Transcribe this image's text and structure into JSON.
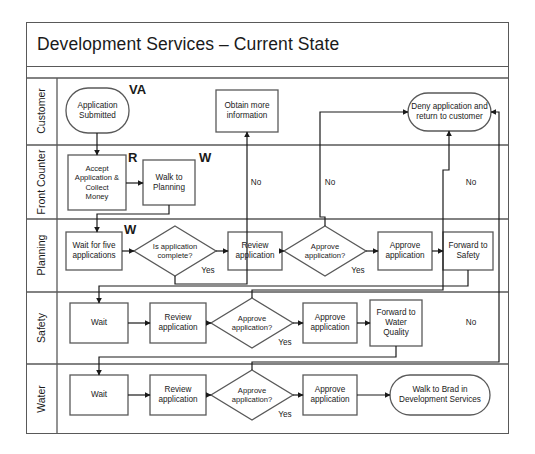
{
  "diagram": {
    "title": "Development Services – Current State",
    "type": "swimlane-flowchart",
    "stroke_color": "#595959",
    "frame_color": "#595959",
    "background": "#ffffff",
    "lanes": [
      {
        "id": "customer",
        "label": "Customer"
      },
      {
        "id": "front-counter",
        "label": "Front Counter"
      },
      {
        "id": "planning",
        "label": "Planning"
      },
      {
        "id": "safety",
        "label": "Safety"
      },
      {
        "id": "water",
        "label": "Water"
      }
    ],
    "nodes": [
      {
        "id": "application-submitted",
        "lane": "customer",
        "shape": "terminator",
        "text": "Application\nSubmitted"
      },
      {
        "id": "obtain-more-information",
        "lane": "customer",
        "shape": "process",
        "text": "Obtain more\ninformation"
      },
      {
        "id": "deny-application",
        "lane": "customer",
        "shape": "terminator",
        "text": "Deny application and\nreturn to customer"
      },
      {
        "id": "accept-application",
        "lane": "front-counter",
        "shape": "process",
        "text": "Accept\nApplication &\nCollect\nMoney"
      },
      {
        "id": "walk-to-planning",
        "lane": "front-counter",
        "shape": "process",
        "text": "Walk to\nPlanning"
      },
      {
        "id": "wait-for-five",
        "lane": "planning",
        "shape": "process",
        "text": "Wait for five\napplications"
      },
      {
        "id": "is-application-complete",
        "lane": "planning",
        "shape": "decision",
        "text": "Is application\ncomplete?"
      },
      {
        "id": "planning-review",
        "lane": "planning",
        "shape": "process",
        "text": "Review\napplication"
      },
      {
        "id": "planning-approve-q",
        "lane": "planning",
        "shape": "decision",
        "text": "Approve\napplication?"
      },
      {
        "id": "planning-approve",
        "lane": "planning",
        "shape": "process",
        "text": "Approve\napplication"
      },
      {
        "id": "forward-to-safety",
        "lane": "planning",
        "shape": "process",
        "text": "Forward to\nSafety"
      },
      {
        "id": "safety-wait",
        "lane": "safety",
        "shape": "process",
        "text": "Wait"
      },
      {
        "id": "safety-review",
        "lane": "safety",
        "shape": "process",
        "text": "Review\napplication"
      },
      {
        "id": "safety-approve-q",
        "lane": "safety",
        "shape": "decision",
        "text": "Approve\napplication?"
      },
      {
        "id": "safety-approve",
        "lane": "safety",
        "shape": "process",
        "text": "Approve\napplication"
      },
      {
        "id": "forward-to-water",
        "lane": "safety",
        "shape": "process",
        "text": "Forward to\nWater\nQuality"
      },
      {
        "id": "water-wait",
        "lane": "water",
        "shape": "process",
        "text": "Wait"
      },
      {
        "id": "water-review",
        "lane": "water",
        "shape": "process",
        "text": "Review\napplication"
      },
      {
        "id": "water-approve-q",
        "lane": "water",
        "shape": "decision",
        "text": "Approve\napplication?"
      },
      {
        "id": "water-approve",
        "lane": "water",
        "shape": "process",
        "text": "Approve\napplication"
      },
      {
        "id": "walk-to-brad",
        "lane": "water",
        "shape": "terminator",
        "text": "Walk to Brad in\nDevelopment Services"
      }
    ],
    "edge_labels": [
      {
        "id": "planning-complete-yes",
        "text": "Yes"
      },
      {
        "id": "planning-complete-no",
        "text": "No"
      },
      {
        "id": "planning-approve-yes",
        "text": "Yes"
      },
      {
        "id": "planning-approve-no",
        "text": "No"
      },
      {
        "id": "safety-approve-yes",
        "text": "Yes"
      },
      {
        "id": "safety-approve-no",
        "text": "No"
      },
      {
        "id": "water-approve-yes",
        "text": "Yes"
      },
      {
        "id": "water-approve-no",
        "text": "No"
      }
    ],
    "annotations": [
      {
        "id": "va-marker",
        "text": "VA",
        "meaning": "value-added"
      },
      {
        "id": "r-marker",
        "text": "R",
        "meaning": "required"
      },
      {
        "id": "w-marker-walk-to-planning",
        "text": "W",
        "meaning": "waste"
      },
      {
        "id": "w-marker-wait-for-five",
        "text": "W",
        "meaning": "waste"
      }
    ]
  }
}
